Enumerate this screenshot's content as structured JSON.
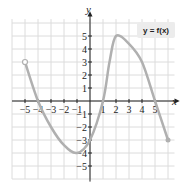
{
  "chart_data": {
    "type": "line",
    "title": "",
    "legend": "y = f(x)",
    "xlabel": "x",
    "ylabel": "y",
    "xlim": [
      -6,
      6
    ],
    "ylim": [
      -6,
      6
    ],
    "grid": true,
    "legend_position": "top-right",
    "x_ticks": [
      -5,
      -4,
      -3,
      -2,
      -1,
      1,
      2,
      3,
      4,
      5
    ],
    "y_ticks": [
      -5,
      -4,
      -3,
      -2,
      -1,
      1,
      2,
      3,
      4,
      5
    ],
    "x_tick_labels": [
      "−5",
      "−4",
      "−3",
      "−2",
      "−1",
      "1",
      "2",
      "3",
      "4",
      "5"
    ],
    "y_tick_labels": [
      "−5",
      "−4",
      "−3",
      "−2",
      "−1",
      "1",
      "2",
      "3",
      "4",
      "5"
    ],
    "series": [
      {
        "name": "y = f(x)",
        "color": "#b0b0b0",
        "points": [
          {
            "x": -5,
            "y": 3
          },
          {
            "x": -4,
            "y": 0
          },
          {
            "x": -3,
            "y": -2
          },
          {
            "x": -2,
            "y": -3.4
          },
          {
            "x": -1,
            "y": -4
          },
          {
            "x": 0,
            "y": -3
          },
          {
            "x": 1,
            "y": 0
          },
          {
            "x": 1.5,
            "y": 3
          },
          {
            "x": 2,
            "y": 5
          },
          {
            "x": 3,
            "y": 4.4
          },
          {
            "x": 4,
            "y": 3
          },
          {
            "x": 5,
            "y": 0
          },
          {
            "x": 6,
            "y": -3
          }
        ],
        "start_point": {
          "x": -5,
          "y": 3,
          "style": "open"
        },
        "end_point": {
          "x": 6,
          "y": -3,
          "style": "closed"
        }
      }
    ]
  },
  "colors": {
    "grid": "#dcdcdc",
    "axis": "#222222",
    "curve": "#b0b0b0",
    "legend_bg": "#ececec"
  }
}
